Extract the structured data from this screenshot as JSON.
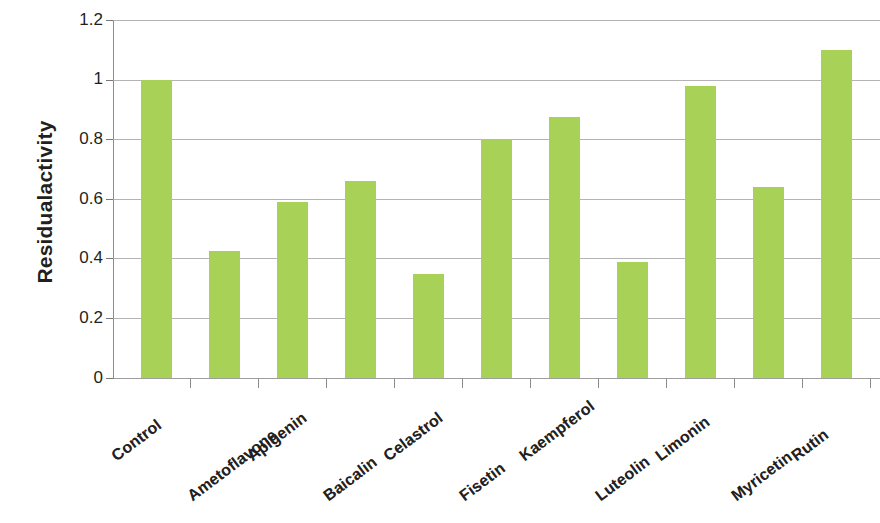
{
  "chart_data": {
    "type": "bar",
    "title": "",
    "xlabel": "",
    "ylabel": "Residualactivity",
    "ylim": [
      0,
      1.2
    ],
    "ytick_labels": [
      "1.2",
      "1",
      "0.8",
      "0.6",
      "0.4",
      "0.2",
      "0"
    ],
    "ytick_values": [
      1.2,
      1.0,
      0.8,
      0.6,
      0.4,
      0.2,
      0
    ],
    "grid": true,
    "legend": "none",
    "bar_color": "#a8d257",
    "categories": [
      "Control",
      "Ametoflavone",
      "Apigenin",
      "Baicalin",
      "Celastrol",
      "Fisetin",
      "Kaempferol",
      "Luteolin",
      "Limonin",
      "Myricetin",
      "Rutin"
    ],
    "values": [
      1.0,
      0.425,
      0.59,
      0.66,
      0.35,
      0.8,
      0.875,
      0.39,
      0.98,
      0.64,
      1.1
    ]
  }
}
